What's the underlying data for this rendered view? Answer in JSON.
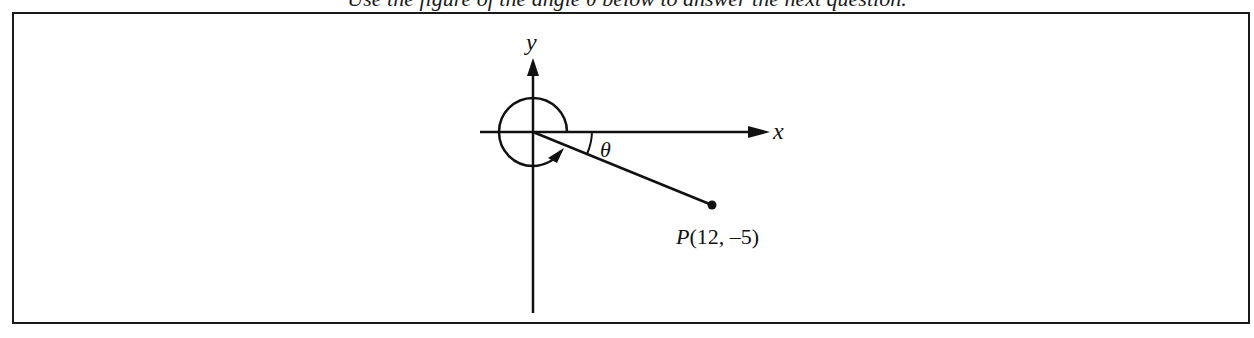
{
  "caption": {
    "text": "Use the figure of the angle θ below to answer the next question."
  },
  "figure": {
    "type": "coordinate-plane-angle",
    "axes": {
      "x_label": "x",
      "y_label": "y"
    },
    "angle": {
      "label": "θ",
      "description": "reference angle between positive x-axis and terminal side, with rotation arc shown nearly a full turn counterclockwise"
    },
    "point": {
      "name": "P",
      "x": 12,
      "y": -5,
      "label": "P(12, –5)"
    },
    "colors": {
      "stroke": "#111111",
      "background": "#ffffff"
    }
  }
}
